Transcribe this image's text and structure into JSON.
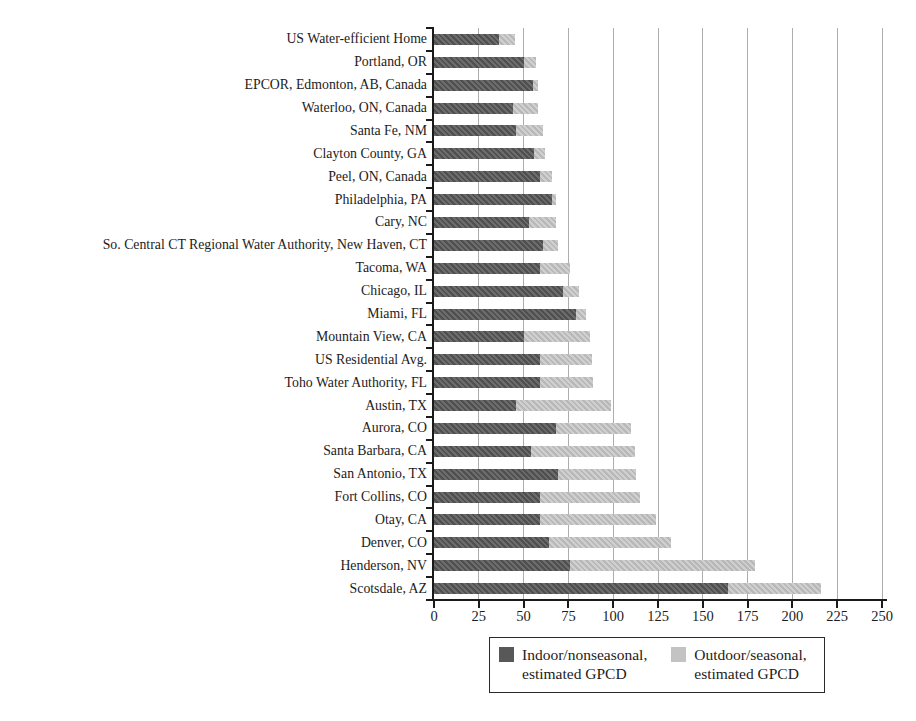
{
  "chart_data": {
    "type": "bar",
    "orientation": "horizontal",
    "stacked": true,
    "title": "",
    "xlabel": "",
    "ylabel": "",
    "xlim": [
      0,
      250
    ],
    "xticks": [
      0,
      25,
      50,
      75,
      100,
      125,
      150,
      175,
      200,
      225,
      250
    ],
    "grid": true,
    "legend_position": "bottom",
    "unit": "GPCD",
    "categories": [
      "US Water-efficient Home",
      "Portland, OR",
      "EPCOR, Edmonton, AB, Canada",
      "Waterloo, ON, Canada",
      "Santa Fe, NM",
      "Clayton County, GA",
      "Peel, ON, Canada",
      "Philadelphia, PA",
      "Cary, NC",
      "So. Central CT Regional Water Authority, New Haven, CT",
      "Tacoma, WA",
      "Chicago, IL",
      "Miami, FL",
      "Mountain View, CA",
      "US Residential Avg.",
      "Toho Water Authority, FL",
      "Austin, TX",
      "Aurora, CO",
      "Santa Barbara, CA",
      "San Antonio, TX",
      "Fort Collins, CO",
      "Otay, CA",
      "Denver, CO",
      "Henderson, NV",
      "Scotsdale, AZ"
    ],
    "series": [
      {
        "name": "Indoor/nonseasonal, estimated GPCD",
        "color": "#585858",
        "values": [
          36,
          50,
          55,
          44,
          46,
          56,
          59,
          66,
          53,
          61,
          59,
          72,
          79,
          50,
          59,
          59,
          46,
          68,
          54,
          69,
          59,
          59,
          64,
          76,
          164
        ]
      },
      {
        "name": "Outdoor/seasonal, estimated GPCD",
        "color": "#c3c3c3",
        "values": [
          9,
          7,
          3,
          14,
          15,
          6,
          7,
          2,
          15,
          8,
          17,
          9,
          6,
          37,
          29,
          30,
          53,
          42,
          58,
          44,
          56,
          65,
          68,
          103,
          52
        ]
      }
    ]
  },
  "legend": {
    "items": [
      {
        "line1": "Indoor/nonseasonal,",
        "line2": "estimated GPCD",
        "color": "#585858"
      },
      {
        "line1": "Outdoor/seasonal,",
        "line2": "estimated GPCD",
        "color": "#c3c3c3"
      }
    ]
  }
}
